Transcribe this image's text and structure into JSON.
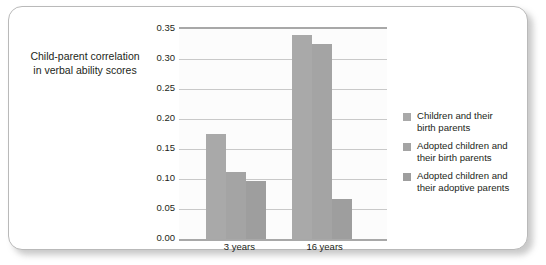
{
  "chart_data": {
    "type": "bar",
    "title": "",
    "xlabel": "",
    "ylabel": "Child-parent correlation in verbal ability scores",
    "ylabel_lines": [
      "Child-parent correlation",
      "in verbal ability scores"
    ],
    "categories": [
      "3 years",
      "16 years"
    ],
    "series": [
      {
        "name": "Children and their birth parents",
        "name_lines": [
          "Children and their",
          "birth parents"
        ],
        "values": [
          0.175,
          0.34
        ],
        "color": "#a9a9a9"
      },
      {
        "name": "Adopted children and their birth parents",
        "name_lines": [
          "Adopted children and",
          "their birth parents"
        ],
        "values": [
          0.112,
          0.325
        ],
        "color": "#a4a4a4"
      },
      {
        "name": "Adopted children and their adoptive parents",
        "name_lines": [
          "Adopted children and",
          "their adoptive parents"
        ],
        "values": [
          0.096,
          0.067
        ],
        "color": "#9e9e9e"
      }
    ],
    "ylim": [
      0.0,
      0.35
    ],
    "ytick_step": 0.05,
    "yticks": [
      "0.00",
      "0.05",
      "0.10",
      "0.15",
      "0.20",
      "0.25",
      "0.30",
      "0.35"
    ],
    "ytick_values": [
      0.0,
      0.05,
      0.1,
      0.15,
      0.2,
      0.25,
      0.3,
      0.35
    ],
    "grid": true,
    "legend_position": "right",
    "plot_background": "#fcfcfc",
    "grid_color": "#c9c9c9",
    "axis_color": "#a8a8a8",
    "text_color": "#231f20",
    "frame_border_color": "#b9b9b9"
  }
}
